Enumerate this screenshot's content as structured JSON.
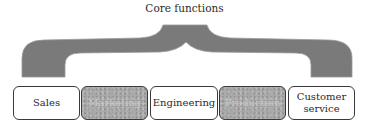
{
  "diagram": {
    "title": "Core functions",
    "connector": "curly-brace",
    "brace_color": "#7a7a7a",
    "functions": [
      {
        "label": "Sales",
        "shaded": false
      },
      {
        "label": "Marketing",
        "shaded": true
      },
      {
        "label": "Engineering",
        "shaded": false
      },
      {
        "label": "Production",
        "shaded": true
      },
      {
        "label": "Customer service",
        "shaded": false
      }
    ]
  }
}
